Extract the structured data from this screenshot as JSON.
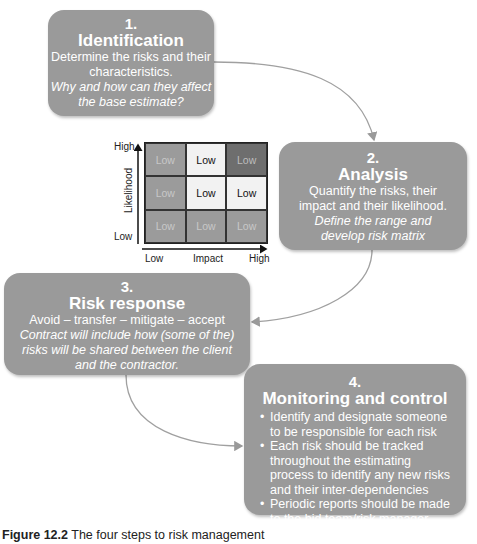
{
  "steps": [
    {
      "number": "1.",
      "title": "Identification",
      "description": [
        "Determine the risks and  their",
        "characteristics."
      ],
      "italic": [
        "Why and how can they  affect",
        "the base estimate?"
      ]
    },
    {
      "number": "2.",
      "title": "Analysis",
      "description": [
        "Quantify the risks, their",
        "impact and their likelihood."
      ],
      "italic": [
        "Define the range and",
        "develop risk matrix"
      ]
    },
    {
      "number": "3.",
      "title": "Risk response",
      "description": [
        "Avoid – transfer – mitigate – accept"
      ],
      "italic": [
        "Contract will include how (some of the)",
        "risks will be shared between the client",
        "and the contractor."
      ]
    },
    {
      "number": "4.",
      "title": "Monitoring and control",
      "bullets": [
        "Identify and designate someone to be responsible for each risk",
        "Each risk should be tracked throughout the estimating process to identify any new risks and their inter-dependencies",
        "Periodic reports should be made to the bid team/risk manager"
      ]
    }
  ],
  "risk_matrix": {
    "y_axis": {
      "label": "Likelihood",
      "high": "High",
      "low": "Low"
    },
    "x_axis": {
      "label": "Impact",
      "low": "Low",
      "high": "High"
    },
    "cells": [
      [
        {
          "text": "Low",
          "bg": "#9b9b9b",
          "fg": "#c8c8c8"
        },
        {
          "text": "Low",
          "bg": "#f2f2f2",
          "fg": "#111111"
        },
        {
          "text": "Low",
          "bg": "#6e6e6e",
          "fg": "#bdbdbd"
        }
      ],
      [
        {
          "text": "Low",
          "bg": "#9b9b9b",
          "fg": "#c8c8c8"
        },
        {
          "text": "Low",
          "bg": "#f2f2f2",
          "fg": "#111111"
        },
        {
          "text": "Low",
          "bg": "#f2f2f2",
          "fg": "#111111"
        }
      ],
      [
        {
          "text": "Low",
          "bg": "#9b9b9b",
          "fg": "#c8c8c8"
        },
        {
          "text": "Low",
          "bg": "#9b9b9b",
          "fg": "#c8c8c8"
        },
        {
          "text": "Low",
          "bg": "#9b9b9b",
          "fg": "#c8c8c8"
        }
      ]
    ]
  },
  "caption": {
    "label": "Figure 12.2",
    "text": "The four steps to risk management"
  },
  "colors": {
    "box": "#9a9a9a",
    "connector": "#9a9a9a"
  }
}
